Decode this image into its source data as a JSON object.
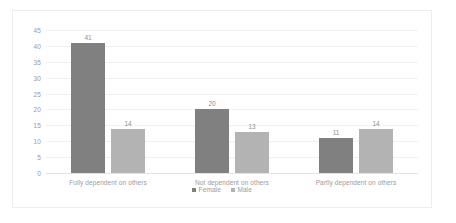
{
  "chart_data": {
    "type": "bar",
    "title": "",
    "xlabel": "",
    "ylabel": "",
    "categories": [
      "Fully dependent on others",
      "Not dependent on others",
      "Partly dependent on others"
    ],
    "series": [
      {
        "name": "Female",
        "color": "#808080",
        "values": [
          41,
          20,
          11
        ]
      },
      {
        "name": "Male",
        "color": "#b3b3b3",
        "values": [
          14,
          13,
          14
        ]
      }
    ],
    "ylim": [
      0,
      45
    ],
    "ytick_step": 5,
    "yticks": [
      "0",
      "5",
      "10",
      "15",
      "20",
      "25",
      "30",
      "35",
      "40",
      "45"
    ],
    "grid": true,
    "legend_position": "bottom",
    "data_labels": [
      "41",
      "14",
      "20",
      "13",
      "11",
      "14"
    ],
    "colors": {
      "gridline": "#f0f0f0",
      "axis": "#e2e2e2",
      "text": "#9a9a9a",
      "border": "#ededed",
      "background": "#ffffff"
    }
  }
}
